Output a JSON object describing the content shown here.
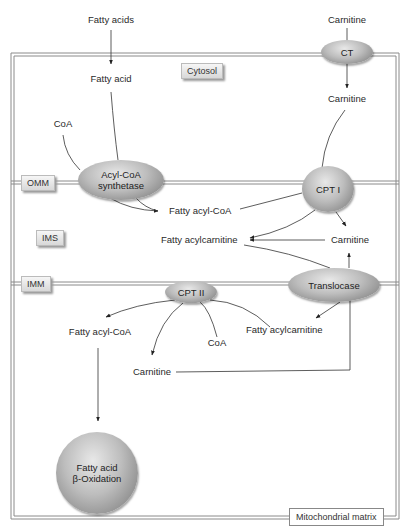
{
  "diagram": {
    "compartments": {
      "cytosol": "Cytosol",
      "omm": "OMM",
      "ims": "IMS",
      "imm": "IMM",
      "matrix": "Mitochondrial matrix"
    },
    "enzymes": {
      "ct": "CT",
      "acyl_coa_synthetase_line1": "Acyl-CoA",
      "acyl_coa_synthetase_line2": "synthetase",
      "cpt1": "CPT I",
      "translocase": "Translocase",
      "cpt2": "CPT II",
      "beta_oxidation_line1": "Fatty acid",
      "beta_oxidation_line2": "β-Oxidation"
    },
    "metabolites": {
      "fatty_acids_outside": "Fatty acids",
      "carnitine_outside": "Carnitine",
      "fatty_acid_cytosol": "Fatty acid",
      "coa_cytosol": "CoA",
      "carnitine_cytosol": "Carnitine",
      "fatty_acyl_coa_ims": "Fatty acyl-CoA",
      "fatty_acylcarnitine_ims": "Fatty acylcarnitine",
      "carnitine_ims": "Carnitine",
      "fatty_acyl_coa_matrix": "Fatty acyl-CoA",
      "coa_matrix": "CoA",
      "fatty_acylcarnitine_matrix": "Fatty acylcarnitine",
      "carnitine_matrix": "Carnitine"
    },
    "colors": {
      "membrane": "#9a9a9a",
      "arrow": "#333333",
      "enzyme_fill": "#b8b8b8"
    }
  }
}
